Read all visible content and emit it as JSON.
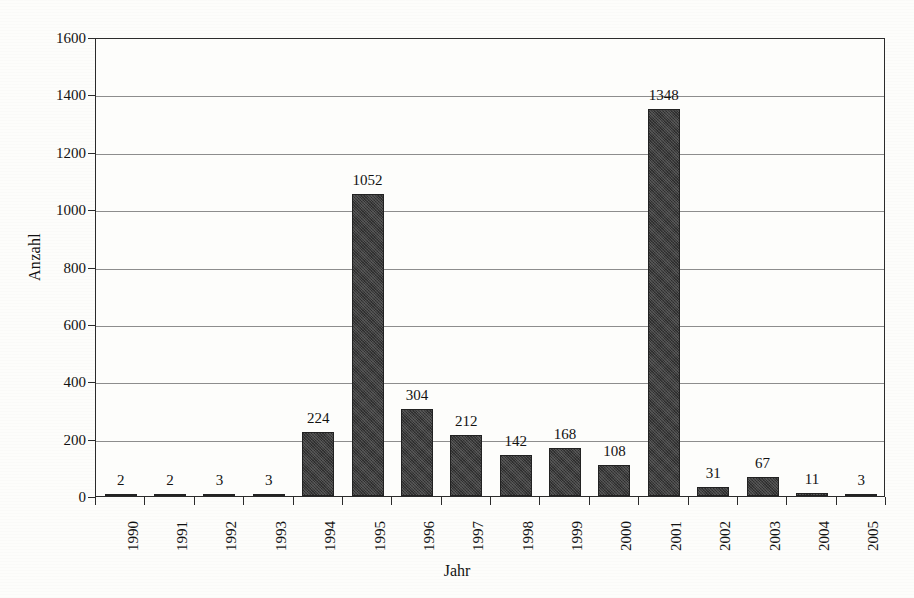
{
  "chart_data": {
    "type": "bar",
    "title": "",
    "xlabel": "Jahr",
    "ylabel": "Anzahl",
    "categories": [
      "1990",
      "1991",
      "1992",
      "1993",
      "1994",
      "1995",
      "1996",
      "1997",
      "1998",
      "1999",
      "2000",
      "2001",
      "2002",
      "2003",
      "2004",
      "2005"
    ],
    "values": [
      2,
      2,
      3,
      3,
      224,
      1052,
      304,
      212,
      142,
      168,
      108,
      1348,
      31,
      67,
      11,
      3
    ],
    "data_labels": [
      "2",
      "2",
      "3",
      "3",
      "224",
      "1052",
      "304",
      "212",
      "142",
      "168",
      "108",
      "1348",
      "31",
      "67",
      "11",
      "3"
    ],
    "ylim": [
      0,
      1600
    ],
    "ytick_values": [
      0,
      200,
      400,
      600,
      800,
      1000,
      1200,
      1400,
      1600
    ],
    "ytick_labels": [
      "0",
      "200",
      "400",
      "600",
      "800",
      "1000",
      "1200",
      "1400",
      "1600"
    ],
    "grid": true,
    "grid_axis": "y",
    "legend": false,
    "legend_position": "none",
    "bar_color": "#3b3b3b",
    "gridline_color": "#8d8d8d",
    "axis_color": "#2b2b2b",
    "background_color": "#fdfdfb"
  }
}
